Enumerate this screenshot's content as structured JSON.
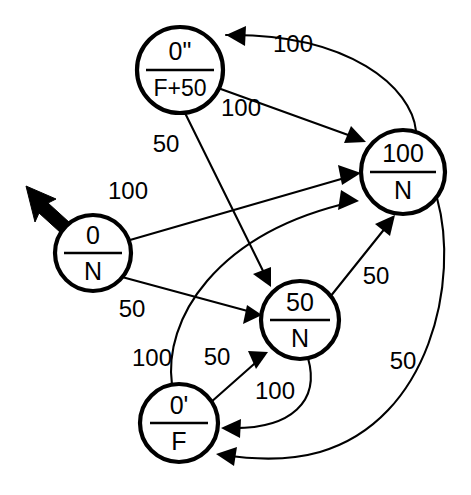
{
  "diagram": {
    "colors": {
      "stroke": "#000000",
      "background": "#ffffff",
      "label": "#000000"
    },
    "nodes": [
      {
        "id": "n0dq",
        "numerator": "0\"",
        "denominator": "F+50",
        "cx": 180,
        "cy": 70,
        "r": 43
      },
      {
        "id": "n100",
        "numerator": "100",
        "denominator": "N",
        "cx": 403,
        "cy": 172,
        "r": 42
      },
      {
        "id": "n0",
        "numerator": "0",
        "denominator": "N",
        "cx": 93,
        "cy": 253,
        "r": 38
      },
      {
        "id": "n50",
        "numerator": "50",
        "denominator": "N",
        "cx": 300,
        "cy": 320,
        "r": 39
      },
      {
        "id": "n0pr",
        "numerator": "0'",
        "denominator": "F",
        "cx": 179,
        "cy": 423,
        "r": 39
      }
    ],
    "start_marker": {
      "from_node": "n0",
      "label": "initial-state-arrow"
    },
    "edges": [
      {
        "id": "e1",
        "from": "n100",
        "to": "n0dq",
        "label": "100",
        "label_x": 293,
        "label_y": 46
      },
      {
        "id": "e2",
        "from": "n0dq",
        "to": "n100",
        "label": "100",
        "label_x": 241,
        "label_y": 110
      },
      {
        "id": "e3",
        "from": "n0dq",
        "to": "n50",
        "label": "50",
        "label_x": 166,
        "label_y": 146
      },
      {
        "id": "e4",
        "from": "n0",
        "to": "n100",
        "label": "100",
        "label_x": 128,
        "label_y": 193
      },
      {
        "id": "e5",
        "from": "n0",
        "to": "n50",
        "label": "50",
        "label_x": 132,
        "label_y": 311
      },
      {
        "id": "e6",
        "from": "n0pr",
        "to": "n100",
        "label": "100",
        "label_x": 152,
        "label_y": 360
      },
      {
        "id": "e7",
        "from": "n0pr",
        "to": "n50",
        "label": "50",
        "label_x": 217,
        "label_y": 359
      },
      {
        "id": "e8",
        "from": "n50",
        "to": "n0pr",
        "label": "100",
        "label_x": 275,
        "label_y": 393
      },
      {
        "id": "e9",
        "from": "n50",
        "to": "n100",
        "label": "50",
        "label_x": 376,
        "label_y": 278
      },
      {
        "id": "e10",
        "from": "n100",
        "to": "n0pr",
        "label": "50",
        "label_x": 403,
        "label_y": 363
      }
    ]
  }
}
